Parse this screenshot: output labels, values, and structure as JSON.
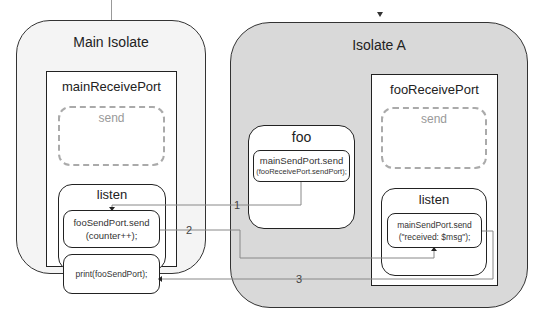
{
  "main_isolate": {
    "title": "Main Isolate",
    "receive_port": {
      "title": "mainReceivePort",
      "send_label": "send",
      "listen": {
        "title": "listen",
        "statements": [
          "fooSendPort.send",
          "(counter++);",
          "print(fooSendPort);"
        ]
      }
    }
  },
  "isolate_a": {
    "title": "Isolate A",
    "foo": {
      "title": "foo",
      "line1": "mainSendPort.send",
      "line2": "(fooReceivePort.sendPort);"
    },
    "receive_port": {
      "title": "fooReceivePort",
      "send_label": "send",
      "listen": {
        "title": "listen",
        "line1": "mainSendPort.send",
        "line2": "(\"received: $msg\");"
      }
    }
  },
  "arrows": [
    {
      "label": "1",
      "from": "foo",
      "to": "mainReceivePort.listen"
    },
    {
      "label": "2",
      "from": "fooSendPort.send(counter++)",
      "to": "fooReceivePort.listen"
    },
    {
      "label": "3",
      "from": "fooReceivePort.listen",
      "to": "print(fooSendPort)"
    }
  ],
  "colors": {
    "isolate_a_fill": "#d9d9d9",
    "main_fill": "#f4f4f4",
    "line": "#222222",
    "dashed": "#aaaaaa"
  }
}
